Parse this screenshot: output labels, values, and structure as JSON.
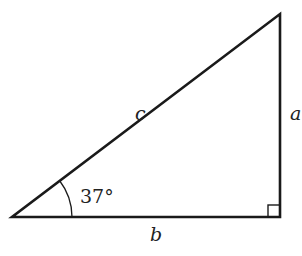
{
  "diagram": {
    "type": "right-triangle",
    "labels": {
      "hypotenuse": "c",
      "vertical_side": "a",
      "base": "b",
      "angle": "37°"
    },
    "vertices": {
      "left": [
        12,
        217
      ],
      "right_angle": [
        280,
        217
      ],
      "top": [
        280,
        14
      ]
    },
    "stroke_color": "#1a1a1a"
  }
}
